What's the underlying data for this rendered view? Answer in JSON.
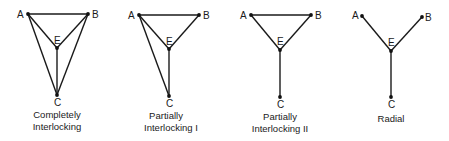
{
  "diagrams": [
    {
      "id": "completely-interlocking",
      "caption": [
        "Completely",
        "Interlocking"
      ],
      "nodes": {
        "A": {
          "label": "A",
          "x": 28,
          "y": 14
        },
        "B": {
          "label": "B",
          "x": 88,
          "y": 14
        },
        "E": {
          "label": "E",
          "x": 57,
          "y": 48
        },
        "C": {
          "label": "C",
          "x": 57,
          "y": 95
        }
      },
      "edges": [
        [
          "A",
          "B"
        ],
        [
          "A",
          "E"
        ],
        [
          "B",
          "E"
        ],
        [
          "E",
          "C"
        ],
        [
          "A",
          "C"
        ],
        [
          "B",
          "C"
        ]
      ]
    },
    {
      "id": "partially-interlocking-1",
      "caption": [
        "Partially",
        "Interlocking I"
      ],
      "nodes": {
        "A": {
          "label": "A",
          "x": 139,
          "y": 15
        },
        "B": {
          "label": "B",
          "x": 199,
          "y": 15
        },
        "E": {
          "label": "E",
          "x": 169,
          "y": 49
        },
        "C": {
          "label": "C",
          "x": 169,
          "y": 96
        }
      },
      "edges": [
        [
          "A",
          "B"
        ],
        [
          "A",
          "E"
        ],
        [
          "B",
          "E"
        ],
        [
          "E",
          "C"
        ],
        [
          "A",
          "C"
        ]
      ]
    },
    {
      "id": "partially-interlocking-2",
      "caption": [
        "Partially",
        "Interlocking II"
      ],
      "nodes": {
        "A": {
          "label": "A",
          "x": 251,
          "y": 15
        },
        "B": {
          "label": "B",
          "x": 311,
          "y": 15
        },
        "E": {
          "label": "E",
          "x": 280,
          "y": 50
        },
        "C": {
          "label": "C",
          "x": 280,
          "y": 97
        }
      },
      "edges": [
        [
          "A",
          "B"
        ],
        [
          "A",
          "E"
        ],
        [
          "B",
          "E"
        ],
        [
          "E",
          "C"
        ]
      ]
    },
    {
      "id": "radial",
      "caption": [
        "Radial"
      ],
      "nodes": {
        "A": {
          "label": "A",
          "x": 362,
          "y": 16
        },
        "B": {
          "label": "B",
          "x": 422,
          "y": 17
        },
        "E": {
          "label": "E",
          "x": 391,
          "y": 51
        },
        "C": {
          "label": "C",
          "x": 391,
          "y": 97
        }
      },
      "edges": [
        [
          "A",
          "E"
        ],
        [
          "B",
          "E"
        ],
        [
          "E",
          "C"
        ]
      ]
    }
  ]
}
